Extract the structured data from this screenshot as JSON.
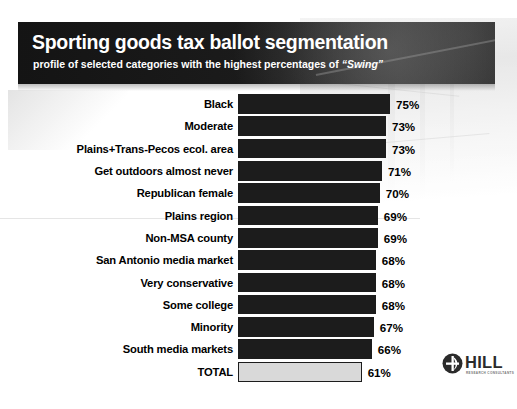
{
  "header": {
    "title": "Sporting goods tax ballot segmentation",
    "subtitle_before": "profile of selected categories with the highest percentages of ",
    "subtitle_emphasis": "“Swing”"
  },
  "logo": {
    "name": "HILL",
    "tagline": "RESEARCH CONSULTANTS"
  },
  "colors": {
    "header_band": "#1a1a1a",
    "bar_fill": "#1c1c1c",
    "total_bar_fill": "#d9d9d9",
    "total_bar_border": "#1c1c1c",
    "background": "#ffffff",
    "title_text": "#ffffff",
    "label_text": "#000000"
  },
  "chart_data": {
    "type": "bar",
    "orientation": "horizontal",
    "title": "Sporting goods tax ballot segmentation",
    "subtitle": "profile of selected categories with the highest percentages of “Swing”",
    "xlabel": "",
    "ylabel": "",
    "value_suffix": "%",
    "xlim": [
      0,
      75
    ],
    "grid": false,
    "legend": false,
    "categories": [
      "Black",
      "Moderate",
      "Plains+Trans-Pecos ecol. area",
      "Get outdoors almost never",
      "Republican female",
      "Plains region",
      "Non-MSA county",
      "San Antonio media market",
      "Very conservative",
      "Some college",
      "Minority",
      "South media markets",
      "TOTAL"
    ],
    "values": [
      75,
      73,
      73,
      71,
      70,
      69,
      69,
      68,
      68,
      68,
      67,
      66,
      61
    ],
    "value_labels": [
      "75%",
      "73%",
      "73%",
      "71%",
      "70%",
      "69%",
      "69%",
      "68%",
      "68%",
      "68%",
      "67%",
      "66%",
      "61%"
    ],
    "rows": [
      {
        "label": "Black",
        "value": 75,
        "value_label": "75%",
        "total": false
      },
      {
        "label": "Moderate",
        "value": 73,
        "value_label": "73%",
        "total": false
      },
      {
        "label": "Plains+Trans-Pecos ecol. area",
        "value": 73,
        "value_label": "73%",
        "total": false
      },
      {
        "label": "Get outdoors almost never",
        "value": 71,
        "value_label": "71%",
        "total": false
      },
      {
        "label": "Republican female",
        "value": 70,
        "value_label": "70%",
        "total": false
      },
      {
        "label": "Plains region",
        "value": 69,
        "value_label": "69%",
        "total": false
      },
      {
        "label": "Non-MSA county",
        "value": 69,
        "value_label": "69%",
        "total": false
      },
      {
        "label": "San Antonio media market",
        "value": 68,
        "value_label": "68%",
        "total": false
      },
      {
        "label": "Very conservative",
        "value": 68,
        "value_label": "68%",
        "total": false
      },
      {
        "label": "Some college",
        "value": 68,
        "value_label": "68%",
        "total": false
      },
      {
        "label": "Minority",
        "value": 67,
        "value_label": "67%",
        "total": false
      },
      {
        "label": "South media markets",
        "value": 66,
        "value_label": "66%",
        "total": false
      },
      {
        "label": "TOTAL",
        "value": 61,
        "value_label": "61%",
        "total": true
      }
    ]
  }
}
